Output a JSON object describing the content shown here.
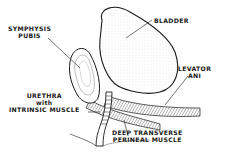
{
  "diagram": {
    "type": "anatomical-illustration",
    "colors": {
      "ink": "#1a1a1a",
      "background": "#ffffff",
      "stipple": "#9a9a9a"
    },
    "labels": {
      "symphysis": {
        "line1": "SYMPHYSIS",
        "line2": "PUBIS"
      },
      "bladder": {
        "line1": "BLADDER"
      },
      "levator": {
        "line1": "LEVATOR",
        "line2": "ANI"
      },
      "urethra": {
        "line1": "URETHRA",
        "line2": "with",
        "line3": "INTRINSIC MUSCLE"
      },
      "deep_transverse": {
        "line1": "DEEP TRANSVERSE",
        "line2": "PERINEAL MUSCLE"
      }
    }
  }
}
